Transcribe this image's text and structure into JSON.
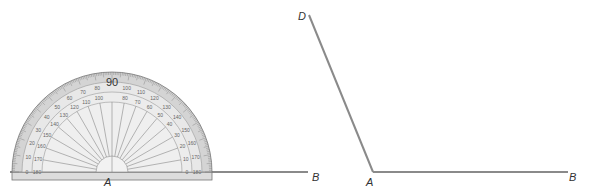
{
  "figure_left": {
    "description": "Protractor placed on angle vertex A along ray AB",
    "protractor": {
      "center_label": "90",
      "outer_scale": [
        "0",
        "10",
        "20",
        "30",
        "40",
        "50",
        "60",
        "70",
        "80",
        "90",
        "100",
        "110",
        "120",
        "130",
        "140",
        "150",
        "160",
        "170",
        "180"
      ],
      "inner_scale": [
        "180",
        "170",
        "160",
        "150",
        "140",
        "130",
        "120",
        "110",
        "100",
        "90",
        "80",
        "70",
        "60",
        "50",
        "40",
        "30",
        "20",
        "10",
        "0"
      ]
    },
    "labels": {
      "vertex": "A",
      "ray_end": "B"
    }
  },
  "figure_right": {
    "description": "Angle DAB",
    "labels": {
      "top": "D",
      "vertex": "A",
      "ray_end": "B"
    }
  },
  "colors": {
    "line": "#888888",
    "protractor_fill": "#e6e6e6",
    "protractor_band": "#cfcfcf",
    "protractor_edge": "#777777",
    "label": "#333333"
  }
}
